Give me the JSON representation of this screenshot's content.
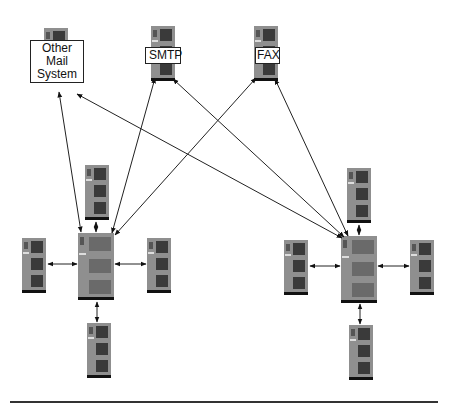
{
  "diagram": {
    "external_systems": [
      {
        "id": "other-mail",
        "label_line1": "Other Mail",
        "label_line2": "System"
      },
      {
        "id": "smtp",
        "label": "SMTP"
      },
      {
        "id": "fax",
        "label": "FAX"
      }
    ],
    "clusters": [
      {
        "id": "left-cluster",
        "hub": "central server",
        "satellites": [
          "top",
          "left",
          "right",
          "bottom"
        ]
      },
      {
        "id": "right-cluster",
        "hub": "central server",
        "satellites": [
          "top",
          "left",
          "right",
          "bottom"
        ]
      }
    ],
    "connections": [
      {
        "from": "left-hub",
        "to": "other-mail"
      },
      {
        "from": "left-hub",
        "to": "smtp"
      },
      {
        "from": "left-hub",
        "to": "fax"
      },
      {
        "from": "right-hub",
        "to": "other-mail"
      },
      {
        "from": "right-hub",
        "to": "smtp"
      },
      {
        "from": "right-hub",
        "to": "fax"
      }
    ],
    "colors": {
      "server": "#8c8c8c",
      "grille": "#3a3a3a",
      "base": "#111111",
      "line": "#222222"
    }
  }
}
